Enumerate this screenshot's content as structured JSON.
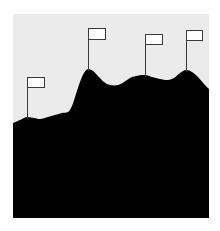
{
  "illustration": {
    "description": "Mountain range silhouette with flags planted on peaks",
    "colors": {
      "page_background": "#ffffff",
      "sky": "#ebebeb",
      "mountain": "#000000",
      "flag_fill": "#ffffff",
      "flag_stroke": "#3a3a3a"
    },
    "panel": {
      "x": 13,
      "y": 14,
      "width": 196,
      "height": 204
    },
    "mountain_profile": [
      [
        13,
        123
      ],
      [
        20,
        120
      ],
      [
        27,
        117
      ],
      [
        34,
        118
      ],
      [
        40,
        119
      ],
      [
        48,
        117
      ],
      [
        55,
        115
      ],
      [
        62,
        113
      ],
      [
        68,
        112
      ],
      [
        72,
        106
      ],
      [
        76,
        94
      ],
      [
        80,
        82
      ],
      [
        84,
        73
      ],
      [
        88,
        69
      ],
      [
        93,
        71
      ],
      [
        98,
        76
      ],
      [
        104,
        82
      ],
      [
        110,
        85
      ],
      [
        118,
        85
      ],
      [
        124,
        82
      ],
      [
        130,
        78
      ],
      [
        136,
        76
      ],
      [
        145,
        75
      ],
      [
        152,
        77
      ],
      [
        160,
        79
      ],
      [
        168,
        80
      ],
      [
        174,
        78
      ],
      [
        180,
        73
      ],
      [
        186,
        70
      ],
      [
        192,
        72
      ],
      [
        198,
        77
      ],
      [
        204,
        84
      ],
      [
        209,
        89
      ]
    ],
    "flags": [
      {
        "name": "flag-1",
        "pole_x": 27,
        "base_y": 117,
        "rect": {
          "x": 27,
          "y": 77,
          "w": 17,
          "h": 10
        }
      },
      {
        "name": "flag-2",
        "pole_x": 88,
        "base_y": 69,
        "rect": {
          "x": 88,
          "y": 28,
          "w": 17,
          "h": 11
        }
      },
      {
        "name": "flag-3",
        "pole_x": 145,
        "base_y": 75,
        "rect": {
          "x": 145,
          "y": 34,
          "w": 17,
          "h": 10
        }
      },
      {
        "name": "flag-4",
        "pole_x": 186,
        "base_y": 70,
        "rect": {
          "x": 186,
          "y": 30,
          "w": 16,
          "h": 10
        }
      }
    ]
  }
}
